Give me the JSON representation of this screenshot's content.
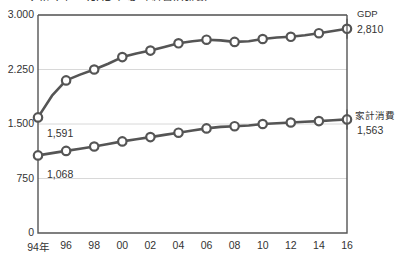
{
  "title_clipped": "ノルウェー GDP と家計消費の推移",
  "chart_data": {
    "type": "line",
    "title": "",
    "xlabel": "",
    "ylabel": "",
    "ylim": [
      0,
      3000
    ],
    "yticks": [
      "0",
      "750",
      "1.500",
      "2.250",
      "3.000"
    ],
    "ytick_values": [
      0,
      750,
      1500,
      2250,
      3000
    ],
    "grid": true,
    "legend_position": "right-inline",
    "x": [
      1994,
      1995,
      1996,
      1997,
      1998,
      1999,
      2000,
      2001,
      2002,
      2003,
      2004,
      2005,
      2006,
      2007,
      2008,
      2009,
      2010,
      2011,
      2012,
      2013,
      2014,
      2015,
      2016
    ],
    "xtick_labels": [
      "94年",
      "96",
      "98",
      "00",
      "02",
      "04",
      "06",
      "08",
      "10",
      "12",
      "14",
      "16"
    ],
    "xtick_values": [
      1994,
      1996,
      1998,
      2000,
      2002,
      2004,
      2006,
      2008,
      2010,
      2012,
      2014,
      2016
    ],
    "series": [
      {
        "name": "GDP",
        "end_label": "2,810",
        "start_label": "1,591",
        "values": [
          1591,
          1890,
          2100,
          2180,
          2250,
          2330,
          2420,
          2470,
          2510,
          2560,
          2610,
          2640,
          2660,
          2650,
          2630,
          2640,
          2670,
          2690,
          2700,
          2720,
          2750,
          2780,
          2810
        ]
      },
      {
        "name": "家計消費",
        "end_label": "1,563",
        "start_label": "1,068",
        "values": [
          1068,
          1100,
          1130,
          1160,
          1190,
          1225,
          1260,
          1290,
          1320,
          1350,
          1380,
          1410,
          1440,
          1460,
          1470,
          1480,
          1500,
          1510,
          1520,
          1530,
          1540,
          1552,
          1563
        ]
      }
    ]
  },
  "annotations": {
    "gdp_name": "GDP",
    "gdp_end": "2,810",
    "gdp_start": "1,591",
    "hc_name": "家計消費",
    "hc_end": "1,563",
    "hc_start": "1,068"
  },
  "colors": {
    "line": "#555555",
    "marker_fill": "#ffffff",
    "axis": "#555555",
    "grid": "#d8d8d8",
    "text": "#333333"
  }
}
